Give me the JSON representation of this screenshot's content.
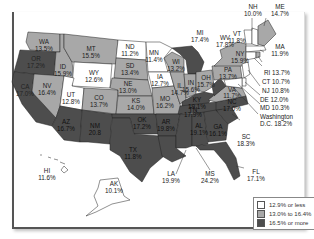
{
  "map": {
    "type": "choropleth",
    "region": "United States",
    "colors": {
      "low": "#ffffff",
      "mid": "#a8a8a8",
      "high": "#4d4d4d",
      "border": "#222222"
    },
    "states": {
      "WA": {
        "name": "WA",
        "value": "13.5%",
        "bin": "mid"
      },
      "OR": {
        "name": "OR",
        "value": "17.2%",
        "bin": "high"
      },
      "CA": {
        "name": "CA",
        "value": "17.0%",
        "bin": "high"
      },
      "ID": {
        "name": "ID",
        "value": "15.9%",
        "bin": "mid"
      },
      "NV": {
        "name": "NV",
        "value": "16.4%",
        "bin": "mid"
      },
      "MT": {
        "name": "MT",
        "value": "15.5%",
        "bin": "mid"
      },
      "WY": {
        "name": "WY",
        "value": "12.6%",
        "bin": "low"
      },
      "UT": {
        "name": "UT",
        "value": "12.8%",
        "bin": "low"
      },
      "AZ": {
        "name": "AZ",
        "value": "16.7%",
        "bin": "high"
      },
      "CO": {
        "name": "CO",
        "value": "13.7%",
        "bin": "mid"
      },
      "NM": {
        "name": "NM",
        "value": "20.8",
        "bin": "high"
      },
      "ND": {
        "name": "ND",
        "value": "11.2%",
        "bin": "low"
      },
      "SD": {
        "name": "SD",
        "value": "13.4%",
        "bin": "mid"
      },
      "NE": {
        "name": "NE",
        "value": "13.0%",
        "bin": "mid"
      },
      "KS": {
        "name": "KS",
        "value": "14.0%",
        "bin": "mid"
      },
      "OK": {
        "name": "OK",
        "value": "17.2%",
        "bin": "high"
      },
      "TX": {
        "name": "TX",
        "value": "11.8%",
        "bin": "high"
      },
      "MN": {
        "name": "MN",
        "value": "11.4%",
        "bin": "low"
      },
      "IA": {
        "name": "IA",
        "value": "12.7%",
        "bin": "low"
      },
      "MO": {
        "name": "MO",
        "value": "16.2%",
        "bin": "mid"
      },
      "AR": {
        "name": "AR",
        "value": "19.8%",
        "bin": "high"
      },
      "LA": {
        "name": "LA",
        "value": "19.9%",
        "bin": "high"
      },
      "WI": {
        "name": "WI",
        "value": "13.2%",
        "bin": "mid"
      },
      "IL": {
        "name": "IL",
        "value": "14.7%",
        "bin": "mid"
      },
      "MI": {
        "name": "MI",
        "value": "17.4%",
        "bin": "high"
      },
      "IN": {
        "name": "IN",
        "value": "15.6%",
        "bin": "mid"
      },
      "OH": {
        "name": "OH",
        "value": "15.7%",
        "bin": "mid"
      },
      "KY": {
        "name": "KY",
        "value": "19.1%",
        "bin": "high"
      },
      "TN": {
        "name": "TN",
        "value": "17.9%",
        "bin": "high"
      },
      "MS": {
        "name": "MS",
        "value": "24.2%",
        "bin": "high"
      },
      "AL": {
        "name": "AL",
        "value": "19.1%",
        "bin": "high"
      },
      "GA": {
        "name": "GA",
        "value": "16.1%",
        "bin": "high"
      },
      "FL": {
        "name": "FL",
        "value": "17.1%",
        "bin": "high"
      },
      "SC": {
        "name": "SC",
        "value": "18.3%",
        "bin": "high"
      },
      "NC": {
        "name": "NC",
        "value": "17.0%",
        "bin": "high"
      },
      "VA": {
        "name": "VA",
        "value": "11.7%",
        "bin": "mid"
      },
      "WV": {
        "name": "WV",
        "value": "17.8%",
        "bin": "high"
      },
      "PA": {
        "name": "PA",
        "value": "13.7%",
        "bin": "mid"
      },
      "NY": {
        "name": "NY",
        "value": "15.9%",
        "bin": "mid"
      },
      "VT": {
        "name": "VT",
        "value": "11.8%",
        "bin": "low"
      },
      "NH": {
        "name": "NH",
        "value": "10.0%",
        "bin": "low"
      },
      "ME": {
        "name": "ME",
        "value": "14.7%",
        "bin": "mid"
      },
      "MA": {
        "name": "MA",
        "value": "11.9%",
        "bin": "low"
      },
      "RI": {
        "name": "RI",
        "value": "13.7%",
        "bin": "mid"
      },
      "CT": {
        "name": "CT",
        "value": "10.7%",
        "bin": "low"
      },
      "NJ": {
        "name": "NJ",
        "value": "10.8%",
        "bin": "low"
      },
      "DE": {
        "name": "DE",
        "value": "12.0%",
        "bin": "low"
      },
      "MD": {
        "name": "MD",
        "value": "10.3%",
        "bin": "low"
      },
      "DC": {
        "name": "Washington",
        "name2": "D.C.",
        "value": "18.2%",
        "bin": "high"
      },
      "HI": {
        "name": "HI",
        "value": "11.6%",
        "bin": "low"
      },
      "AK": {
        "name": "AK",
        "value": "10.1%",
        "bin": "low"
      }
    }
  },
  "labels": {
    "RI_full": "RI 13.7%",
    "CT_full": "CT 10.7%",
    "NJ_full": "NJ 10.8%",
    "DE_full": "DE 12.0%",
    "MD_full": "MD 10.3%",
    "DC_line1": "Washington",
    "DC_line2": "D.C. 18.2%"
  },
  "legend": {
    "items": [
      {
        "label": "12.9% or less",
        "color": "#ffffff"
      },
      {
        "label": "13.0% to 16.4%",
        "color": "#a8a8a8"
      },
      {
        "label": "16.5% or more",
        "color": "#4d4d4d"
      }
    ]
  }
}
